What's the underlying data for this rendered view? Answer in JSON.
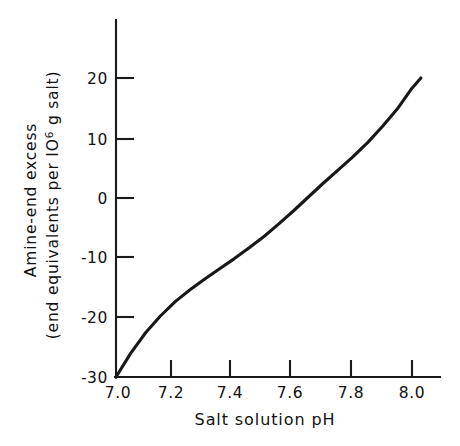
{
  "chart_data": {
    "type": "line",
    "title": "",
    "xlabel": "Salt solution pH",
    "ylabel_line1": "Amine-end excess",
    "ylabel_line2_pre": "(end equivalents per IO",
    "ylabel_line2_sup": "6",
    "ylabel_line2_post": " g salt)",
    "ylabel_full": "Amine-end excess (end equivalents per IO6 g salt)",
    "xlim": [
      7.0,
      8.05
    ],
    "ylim": [
      -30,
      25
    ],
    "grid": false,
    "legend": "none",
    "xticks": [
      7.0,
      7.2,
      7.4,
      7.6,
      7.8,
      8.0
    ],
    "xtick_labels": [
      "7.0",
      "7.2",
      "7.4",
      "7.6",
      "7.8",
      "8.0"
    ],
    "yticks": [
      20,
      10,
      0,
      -10,
      -20,
      -30
    ],
    "ytick_labels": [
      "20",
      "10",
      "0",
      "-10",
      "-20",
      "-30"
    ],
    "series": [
      {
        "name": "amine-end excess vs pH",
        "x": [
          7.0,
          7.05,
          7.1,
          7.15,
          7.2,
          7.25,
          7.3,
          7.35,
          7.4,
          7.45,
          7.5,
          7.55,
          7.6,
          7.65,
          7.7,
          7.75,
          7.8,
          7.85,
          7.9,
          7.95,
          8.0,
          8.03
        ],
        "values": [
          -30.0,
          -26.0,
          -22.6,
          -19.8,
          -17.4,
          -15.4,
          -13.6,
          -11.9,
          -10.2,
          -8.4,
          -6.5,
          -4.4,
          -2.2,
          0.1,
          2.4,
          4.6,
          6.8,
          9.2,
          11.9,
          14.8,
          18.3,
          20.0
        ]
      }
    ]
  },
  "axes": {
    "y_axis_name": "y-axis",
    "x_axis_name": "x-axis"
  }
}
